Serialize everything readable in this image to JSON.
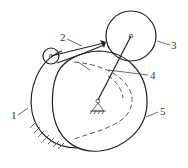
{
  "diagram": {
    "type": "mechanism",
    "labels": [
      {
        "id": "1",
        "text": "1"
      },
      {
        "id": "2",
        "text": "2"
      },
      {
        "id": "3",
        "text": "3"
      },
      {
        "id": "4",
        "text": "4"
      },
      {
        "id": "5",
        "text": "5"
      }
    ],
    "colors": {
      "stroke": "#222222",
      "background": "#ffffff"
    }
  }
}
